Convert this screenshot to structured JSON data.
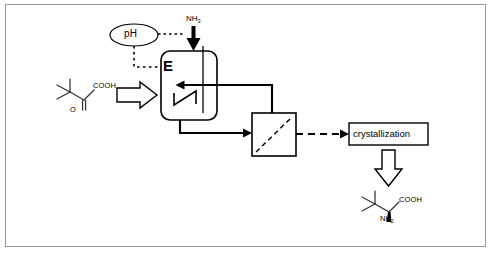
{
  "diagram": {
    "frame_color": "#9a9a9a",
    "line_color": "#000000",
    "background": "#ffffff"
  },
  "labels": {
    "ph_sensor": "pH",
    "ammonia_feed": "NH",
    "ammonia_feed_sub": "3",
    "reactor": "E",
    "crystallization": "crystallization"
  },
  "substrate": {
    "name": "trimethylpyruvic acid",
    "cooh_label": "COOH",
    "ketone_label": "O"
  },
  "product": {
    "name": "tert-leucine",
    "cooh_label": "COOH",
    "amine_label": "NH",
    "amine_label_sub": "2"
  },
  "units": [
    {
      "id": "reactor",
      "label": "E",
      "type": "stirred-tank-reactor"
    },
    {
      "id": "membrane-separator",
      "label": "",
      "type": "membrane-separator"
    },
    {
      "id": "crystallization",
      "label": "crystallization",
      "type": "process-box"
    }
  ],
  "streams": [
    {
      "id": "substrate-feed",
      "style": "hollow-block-arrow",
      "direction": "right"
    },
    {
      "id": "ammonia-feed",
      "style": "solid-thick-arrow",
      "direction": "down"
    },
    {
      "id": "ph-control-signal",
      "style": "dotted",
      "direction": "right"
    },
    {
      "id": "reactor-outlet",
      "style": "solid",
      "direction": "right"
    },
    {
      "id": "retentate-recycle",
      "style": "solid",
      "direction": "left"
    },
    {
      "id": "permeate-to-crystallization",
      "style": "dashed",
      "direction": "right"
    },
    {
      "id": "product-outlet",
      "style": "hollow-block-arrow",
      "direction": "down"
    }
  ]
}
